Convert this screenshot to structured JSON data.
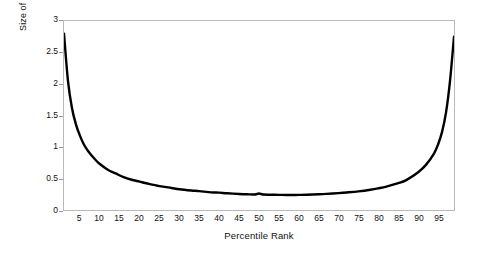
{
  "chart_data": {
    "type": "line",
    "title": "",
    "xlabel": "Percentile Rank",
    "ylabel": "Size of Percentile Rank Unit on T Score Scale",
    "xlim": [
      1,
      99
    ],
    "ylim": [
      0,
      3
    ],
    "grid": false,
    "legend": null,
    "line_color": "#000000",
    "frame_color": "#b9b9b9",
    "background": "#ffffff",
    "xticks": [
      5,
      10,
      15,
      20,
      25,
      30,
      35,
      40,
      45,
      50,
      55,
      60,
      65,
      70,
      75,
      80,
      85,
      90,
      95
    ],
    "yticks": [
      0,
      0.5,
      1,
      1.5,
      2,
      2.5,
      3
    ],
    "ytick_labels": [
      "0",
      "0.5",
      "1",
      "1.5",
      "2",
      "2.5",
      "3"
    ],
    "annotations": [],
    "x": [
      1,
      2,
      3,
      4,
      5,
      6,
      7,
      8,
      9,
      10,
      12,
      14,
      16,
      18,
      20,
      22,
      25,
      28,
      30,
      33,
      35,
      38,
      40,
      42,
      45,
      47,
      49,
      50,
      51,
      53,
      55,
      57,
      58,
      60,
      62,
      65,
      67,
      70,
      72,
      75,
      78,
      80,
      82,
      85,
      87,
      90,
      92,
      94,
      95,
      96,
      97,
      98,
      99
    ],
    "y": [
      2.8,
      2.05,
      1.62,
      1.36,
      1.18,
      1.04,
      0.94,
      0.86,
      0.79,
      0.73,
      0.64,
      0.58,
      0.52,
      0.48,
      0.45,
      0.42,
      0.38,
      0.35,
      0.33,
      0.31,
      0.3,
      0.28,
      0.275,
      0.265,
      0.255,
      0.25,
      0.247,
      0.262,
      0.245,
      0.242,
      0.24,
      0.238,
      0.237,
      0.24,
      0.243,
      0.25,
      0.256,
      0.268,
      0.278,
      0.296,
      0.322,
      0.345,
      0.372,
      0.425,
      0.475,
      0.6,
      0.72,
      0.9,
      1.04,
      1.24,
      1.55,
      2.05,
      2.75
    ]
  }
}
